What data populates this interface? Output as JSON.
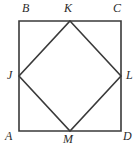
{
  "figure": {
    "name": "square-with-inscribed-square",
    "canvas": {
      "width": 139,
      "height": 150
    },
    "background_color": "#ffffff",
    "stroke_color": "#3a3a3a",
    "stroke_width": 1.6,
    "fill": "none"
  },
  "outer_square": {
    "name": "square-ABCD",
    "vertices": [
      {
        "label": "B",
        "x": 19,
        "y": 21
      },
      {
        "label": "C",
        "x": 121,
        "y": 21
      },
      {
        "label": "D",
        "x": 121,
        "y": 131
      },
      {
        "label": "A",
        "x": 19,
        "y": 131
      }
    ]
  },
  "inner_square": {
    "name": "square-JKLM",
    "vertices": [
      {
        "label": "K",
        "x": 70,
        "y": 21
      },
      {
        "label": "L",
        "x": 121,
        "y": 76
      },
      {
        "label": "M",
        "x": 70,
        "y": 131
      },
      {
        "label": "J",
        "x": 19,
        "y": 76
      }
    ]
  },
  "labels": [
    {
      "id": "label-B",
      "text": "B",
      "x": 22,
      "y": 2,
      "anchor": "outer-top-left"
    },
    {
      "id": "label-K",
      "text": "K",
      "x": 64,
      "y": 2,
      "anchor": "midpoint-top"
    },
    {
      "id": "label-C",
      "text": "C",
      "x": 113,
      "y": 2,
      "anchor": "outer-top-right"
    },
    {
      "id": "label-J",
      "text": "J",
      "x": 7,
      "y": 69,
      "anchor": "midpoint-left"
    },
    {
      "id": "label-L",
      "text": "L",
      "x": 126,
      "y": 69,
      "anchor": "midpoint-right"
    },
    {
      "id": "label-A",
      "text": "A",
      "x": 5,
      "y": 130,
      "anchor": "outer-bottom-left"
    },
    {
      "id": "label-M",
      "text": "M",
      "x": 63,
      "y": 133,
      "anchor": "midpoint-bottom"
    },
    {
      "id": "label-D",
      "text": "D",
      "x": 123,
      "y": 130,
      "anchor": "outer-bottom-right"
    }
  ]
}
